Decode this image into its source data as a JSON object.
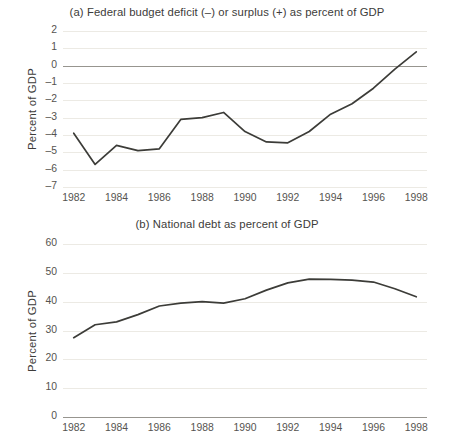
{
  "figure": {
    "background_color": "#ffffff",
    "line_color": "#3c3c38",
    "grid_color": "#eceae4",
    "axis_color": "#97958f",
    "text_color": "#3d3c3a"
  },
  "panel_a": {
    "title": "(a) Federal budget deficit (–) or surplus (+) as percent of GDP",
    "ylabel": "Percent of GDP",
    "ytick_labels": [
      "2",
      "1",
      "0",
      "–1",
      "–2",
      "–3",
      "–4",
      "–5",
      "–6",
      "–7"
    ],
    "xtick_labels": [
      "1982",
      "1984",
      "1986",
      "1988",
      "1990",
      "1992",
      "1994",
      "1996",
      "1998"
    ]
  },
  "panel_b": {
    "title": "(b) National debt as percent of GDP",
    "ylabel": "Percent of GDP",
    "ytick_labels": [
      "60",
      "50",
      "40",
      "30",
      "20",
      "10",
      "0"
    ],
    "xtick_labels": [
      "1982",
      "1984",
      "1986",
      "1988",
      "1990",
      "1992",
      "1994",
      "1996",
      "1998"
    ]
  },
  "chart_data": [
    {
      "type": "line",
      "id": "panel-a",
      "title": "(a) Federal budget deficit (–) or surplus (+) as percent of GDP",
      "xlabel": "",
      "ylabel": "Percent of GDP",
      "xlim": [
        1981.5,
        1998.5
      ],
      "ylim": [
        -7,
        2
      ],
      "yticks": [
        2,
        1,
        0,
        -1,
        -2,
        -3,
        -4,
        -5,
        -6,
        -7
      ],
      "xticks": [
        1982,
        1984,
        1986,
        1988,
        1990,
        1992,
        1994,
        1996,
        1998
      ],
      "grid": true,
      "legend": "none",
      "zero_reference_line": 0,
      "x": [
        1982,
        1983,
        1984,
        1985,
        1986,
        1987,
        1988,
        1989,
        1990,
        1991,
        1992,
        1993,
        1994,
        1995,
        1996,
        1997,
        1998
      ],
      "values": [
        -3.9,
        -5.7,
        -4.6,
        -4.9,
        -4.8,
        -3.1,
        -3.0,
        -2.7,
        -3.8,
        -4.4,
        -4.45,
        -3.8,
        -2.8,
        -2.2,
        -1.3,
        -0.2,
        0.8
      ]
    },
    {
      "type": "line",
      "id": "panel-b",
      "title": "(b) National debt as percent of GDP",
      "xlabel": "",
      "ylabel": "Percent of GDP",
      "xlim": [
        1981.5,
        1998.5
      ],
      "ylim": [
        0,
        60
      ],
      "yticks": [
        60,
        50,
        40,
        30,
        20,
        10,
        0
      ],
      "xticks": [
        1982,
        1984,
        1986,
        1988,
        1990,
        1992,
        1994,
        1996,
        1998
      ],
      "grid": true,
      "legend": "none",
      "x": [
        1982,
        1983,
        1984,
        1985,
        1986,
        1987,
        1988,
        1989,
        1990,
        1991,
        1992,
        1993,
        1994,
        1995,
        1996,
        1997,
        1998
      ],
      "values": [
        27.5,
        32.0,
        33.0,
        35.5,
        38.5,
        39.5,
        40.0,
        39.5,
        41.0,
        44.0,
        46.5,
        47.8,
        47.7,
        47.5,
        46.8,
        44.5,
        41.7
      ]
    }
  ]
}
